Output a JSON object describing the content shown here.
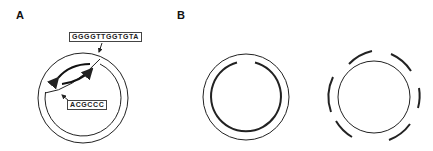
{
  "panels": {
    "a": {
      "label": "A",
      "sequence_top": "GGGGTTGGTGTA",
      "sequence_bottom": "ACGCCC"
    },
    "b": {
      "label": "B"
    }
  },
  "colors": {
    "stroke": "#222222",
    "background": "#ffffff"
  }
}
